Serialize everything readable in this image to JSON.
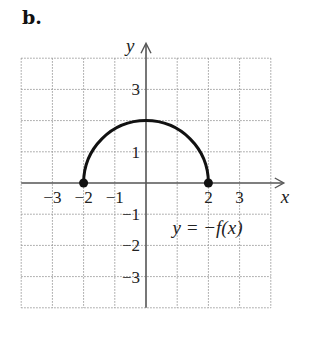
{
  "panel_label": "b.",
  "axes": {
    "x_label": "x",
    "y_label": "y",
    "x_ticks": [
      {
        "value": -3,
        "label": "−3"
      },
      {
        "value": -2,
        "label": "−2"
      },
      {
        "value": -1,
        "label": "−1"
      },
      {
        "value": 2,
        "label": "2"
      },
      {
        "value": 3,
        "label": "3"
      }
    ],
    "y_ticks": [
      {
        "value": 3,
        "label": "3"
      },
      {
        "value": 1,
        "label": "1"
      },
      {
        "value": -1,
        "label": "−1"
      },
      {
        "value": -2,
        "label": "−2"
      },
      {
        "value": -3,
        "label": "−3"
      }
    ],
    "xlim": [
      -4,
      4
    ],
    "ylim": [
      -4,
      4
    ]
  },
  "curve": {
    "equation_label": "y = −f(x)",
    "shape": "upper semicircle",
    "center": [
      0,
      0
    ],
    "radius": 2,
    "endpoints": [
      [
        -2,
        0
      ],
      [
        2,
        0
      ]
    ],
    "endpoint_style": "closed dots"
  }
}
